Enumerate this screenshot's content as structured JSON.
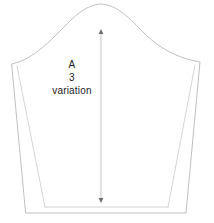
{
  "diagram": {
    "kind": "sewing-pattern",
    "background_color": "#ffffff",
    "line_color": "#b9b9bd",
    "seam_allowance_line_color": "#c8c8cc",
    "grainline_color": "#b4b4b8",
    "text_color": "#1c1c1c"
  },
  "labels": {
    "piece_letter": "A",
    "piece_number": "3",
    "piece_variant": "variation"
  },
  "grainline": {
    "name": "grainline-arrow",
    "top_y": 30,
    "bottom_y": 202,
    "x": 101
  },
  "geometry": {
    "cap_apex": [
      101,
      4
    ],
    "left_shoulder": [
      12,
      64
    ],
    "right_shoulder": [
      200,
      62
    ],
    "bottom_left": [
      26,
      213
    ],
    "bottom_right": [
      186,
      213
    ],
    "hem_inner_left": [
      45,
      207
    ],
    "hem_inner_right": [
      168,
      207
    ]
  }
}
